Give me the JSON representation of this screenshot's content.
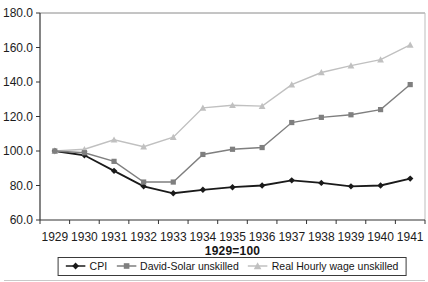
{
  "chart_data": {
    "type": "line",
    "title": "",
    "xlabel": "1929=100",
    "ylabel": "",
    "ylim": [
      60,
      180
    ],
    "ytick_step": 20,
    "ytick_labels": [
      "60.0",
      "80.0",
      "100.0",
      "120.0",
      "140.0",
      "160.0",
      "180.0"
    ],
    "categories": [
      "1929",
      "1930",
      "1931",
      "1932",
      "1933",
      "1934",
      "1935",
      "1936",
      "1937",
      "1938",
      "1939",
      "1940",
      "1941"
    ],
    "grid": false,
    "legend_position": "bottom",
    "axis_color": "#333333",
    "plot_border_top_color": "#8a8a8a",
    "plot_border_right_color": "#bdbdbd",
    "tick_label_color": "#1c1c1c",
    "series": [
      {
        "name": "CPI",
        "marker": "diamond",
        "color": "#1a1a1a",
        "values": [
          100,
          97.5,
          88.5,
          79.5,
          75.5,
          77.5,
          79,
          80,
          83,
          81.5,
          79.5,
          80,
          84
        ]
      },
      {
        "name": "David-Solar unskilled",
        "marker": "square",
        "color": "#7f7f7f",
        "values": [
          100,
          99,
          94,
          82,
          82,
          98,
          101,
          102,
          116.5,
          119.5,
          121,
          124,
          138.5
        ]
      },
      {
        "name": "Real Hourly wage unskilled",
        "marker": "triangle",
        "color": "#c0c0c0",
        "values": [
          100,
          101,
          106.5,
          102.5,
          108,
          125,
          126.5,
          126,
          138.5,
          145.5,
          149.5,
          153,
          161.5
        ]
      }
    ]
  }
}
